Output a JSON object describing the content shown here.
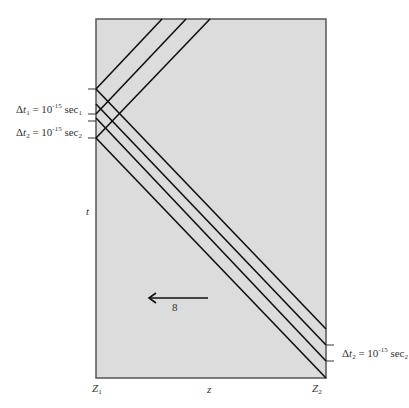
{
  "figure": {
    "axis_labels": {
      "vertical": "t",
      "horizontal": "z",
      "left_position": "Z",
      "left_position_sub": "1",
      "right_position": "Z",
      "right_position_sub": "2"
    },
    "interval_labels": [
      {
        "delta": "Δ",
        "var": "t",
        "var_sub": "1",
        "eq": "= 10",
        "exp": "-15",
        "unit": "sec",
        "unit_sub": "1"
      },
      {
        "delta": "Δ",
        "var": "t",
        "var_sub": "2",
        "eq": "= 10",
        "exp": "-15",
        "unit": "sec",
        "unit_sub": "2"
      },
      {
        "delta": "Δ",
        "var": "t",
        "var_sub": "2",
        "eq": "= 10",
        "exp": "-15",
        "unit": "sec",
        "unit_sub": "2"
      }
    ],
    "arrow_label": "8",
    "colors": {
      "plot_fill": "#dcdcdc",
      "line": "#111111",
      "border": "#555555"
    }
  }
}
